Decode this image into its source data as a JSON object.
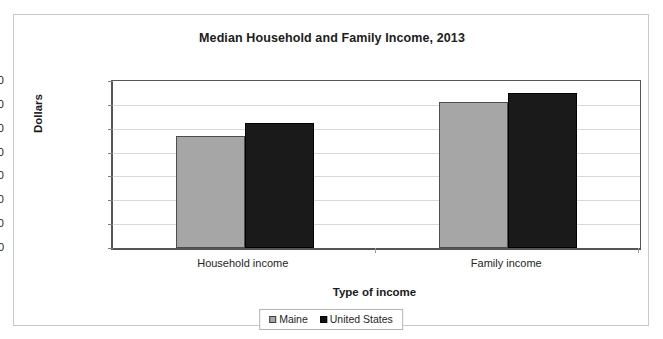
{
  "chart_data": {
    "type": "bar",
    "title": "Median Household and Family Income, 2013",
    "xlabel": "Type of income",
    "ylabel": "Dollars",
    "categories": [
      "Household income",
      "Family income"
    ],
    "series": [
      {
        "name": "Maine",
        "color": "#a6a6a6",
        "values": [
          47000,
          61000
        ]
      },
      {
        "name": "United States",
        "color": "#1a1a1a",
        "values": [
          52500,
          65000
        ]
      }
    ],
    "ylim": [
      0,
      70000
    ],
    "ytick_values": [
      0,
      10000,
      20000,
      30000,
      40000,
      50000,
      60000,
      70000
    ],
    "ytick_labels": [
      "0",
      "10,000",
      "20,000",
      "30,000",
      "40,000",
      "50,000",
      "60,000",
      "70,000"
    ],
    "grid": true,
    "legend_position": "bottom"
  },
  "legend": {
    "entries": [
      {
        "label": "Maine",
        "swatch": "maine-swatch-icon"
      },
      {
        "label": "United States",
        "swatch": "united-states-swatch-icon"
      }
    ]
  }
}
